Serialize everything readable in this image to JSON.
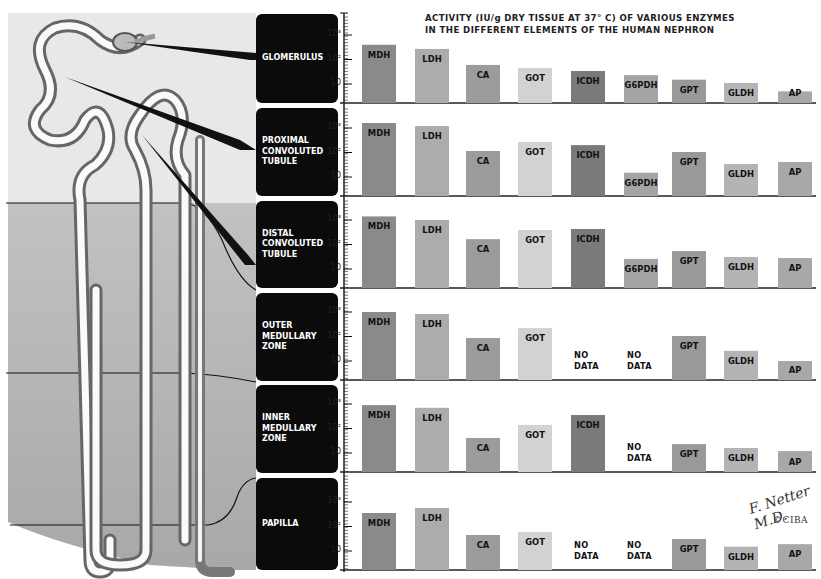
{
  "title": {
    "line1": "ACTIVITY (IU/g DRY TISSUE AT 37° C) OF VARIOUS ENZYMES",
    "line2": "IN THE DIFFERENT ELEMENTS OF THE HUMAN NEPHRON"
  },
  "axis": {
    "tick_labels": [
      "10³",
      "10²",
      "10"
    ]
  },
  "no_data_label": {
    "line1": "NO",
    "line2": "DATA"
  },
  "signature": {
    "name": "F. Netter M.D.",
    "copyright": "©CIBA"
  },
  "colors": {
    "MDH": "#8a8a8a",
    "LDH": "#acacac",
    "CA": "#9c9c9c",
    "GOT": "#d2d2d2",
    "ICDH": "#7a7a7a",
    "G6PDH": "#a4a4a4",
    "GPT": "#999999",
    "GLDH": "#b4b4b4",
    "AP": "#a8a8a8",
    "label_block": "#0b0b0b",
    "cortex_bg": "#e6e6e6",
    "medulla_bg": "#b5b5b5"
  },
  "panels": [
    {
      "label": [
        "GLOMERULUS"
      ]
    },
    {
      "label": [
        "PROXIMAL",
        "CONVOLUTED",
        "TUBULE"
      ]
    },
    {
      "label": [
        "DISTAL",
        "CONVOLUTED",
        "TUBULE"
      ]
    },
    {
      "label": [
        "OUTER",
        "MEDULLARY",
        "ZONE"
      ]
    },
    {
      "label": [
        "INNER",
        "MEDULLARY",
        "ZONE"
      ]
    },
    {
      "label": [
        "PAPILLA"
      ]
    }
  ],
  "chart_data": {
    "type": "bar",
    "title": "ACTIVITY (IU/g DRY TISSUE AT 37° C) OF VARIOUS ENZYMES IN THE DIFFERENT ELEMENTS OF THE HUMAN NEPHRON",
    "xlabel": "",
    "ylabel": "Activity (IU/g dry tissue, log scale)",
    "yscale": "log",
    "ytick_labels": [
      "10",
      "10²",
      "10³"
    ],
    "ylim": [
      1.6,
      5000
    ],
    "grid": false,
    "legend": "none (enzyme names printed on bars)",
    "categories": [
      "MDH",
      "LDH",
      "CA",
      "GOT",
      "ICDH",
      "G6PDH",
      "GPT",
      "GLDH",
      "AP"
    ],
    "series": [
      {
        "name": "GLOMERULUS",
        "values": [
          400,
          270,
          60,
          45,
          34,
          23,
          15,
          11,
          5
        ]
      },
      {
        "name": "PROXIMAL CONVOLUTED TUBULE",
        "values": [
          1600,
          1200,
          115,
          270,
          200,
          15,
          105,
          34,
          41
        ]
      },
      {
        "name": "DISTAL CONVOLUTED TUBULE",
        "values": [
          1400,
          1000,
          165,
          390,
          430,
          26,
          54,
          31,
          28
        ]
      },
      {
        "name": "OUTER MEDULLARY ZONE",
        "values": [
          1000,
          830,
          87,
          220,
          null,
          null,
          105,
          26,
          10
        ]
      },
      {
        "name": "INNER MEDULLARY ZONE",
        "values": [
          900,
          700,
          41,
          140,
          355,
          null,
          23,
          16,
          12
        ]
      },
      {
        "name": "PAPILLA",
        "values": [
          355,
          570,
          45,
          60,
          null,
          null,
          31,
          15,
          19
        ]
      }
    ],
    "annotations": [
      "NO DATA (null values)",
      "F. Netter M.D. ©CIBA"
    ]
  }
}
